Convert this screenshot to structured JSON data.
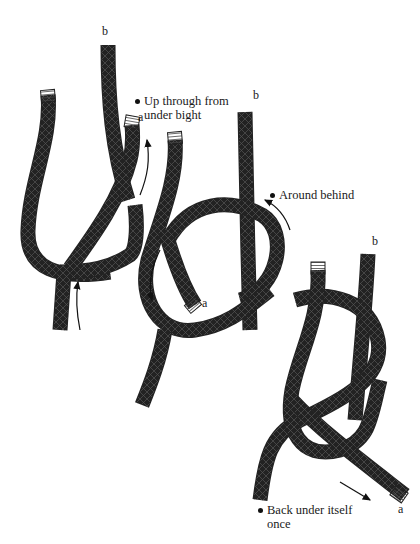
{
  "figure": {
    "title": "",
    "stages": [
      {
        "id": "stage-1",
        "end_labels": {
          "a": "a",
          "b": "b"
        },
        "note": [
          "Up through from",
          "under bight"
        ]
      },
      {
        "id": "stage-2",
        "end_labels": {
          "a": "a",
          "b": "b"
        },
        "note": [
          "Around behind"
        ]
      },
      {
        "id": "stage-3",
        "end_labels": {
          "a": "a",
          "b": "b"
        },
        "note": [
          "Back under itself",
          "once"
        ]
      }
    ]
  },
  "colors": {
    "rope_outline": "#222222",
    "rope_hatch": "#555555",
    "rope_fill": "#ffffff",
    "arrow": "#111111",
    "background": "#ffffff"
  }
}
